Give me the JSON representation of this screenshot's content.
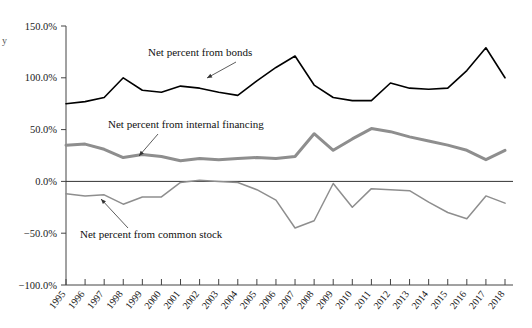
{
  "chart_data": {
    "type": "line",
    "title": "",
    "xlabel": "",
    "ylabel": "",
    "ylim": [
      -100,
      150
    ],
    "yticks": [
      150,
      100,
      50,
      0,
      -50,
      -100
    ],
    "ytick_labels": [
      "150.0%",
      "100.0%",
      "50.0%",
      "0.0%",
      "−50.0%",
      "−100.0%"
    ],
    "grid": false,
    "legend_position": "inline-annotations",
    "zero_line": true,
    "categories": [
      "1995",
      "1996",
      "1997",
      "1998",
      "1999",
      "2000",
      "2001",
      "2002",
      "2003",
      "2004",
      "2005",
      "2006",
      "2007",
      "2008",
      "2009",
      "2010",
      "2011",
      "2012",
      "2013",
      "2014",
      "2015",
      "2016",
      "2017",
      "2018"
    ],
    "series": [
      {
        "name": "Net percent from bonds",
        "color": "#000000",
        "values": [
          75,
          77,
          81,
          100,
          88,
          86,
          92,
          90,
          86,
          83,
          97,
          110,
          121,
          93,
          81,
          78,
          78,
          95,
          90,
          89,
          90,
          107,
          129,
          100
        ]
      },
      {
        "name": "Net percent from internal financing",
        "color": "#8e8e8e",
        "values": [
          35,
          36,
          31,
          23,
          26,
          24,
          20,
          22,
          21,
          22,
          23,
          22,
          24,
          46,
          30,
          41,
          51,
          48,
          43,
          39,
          35,
          30,
          21,
          30
        ]
      },
      {
        "name": "Net percent from common stock",
        "color": "#8e8e8e",
        "values": [
          -12,
          -14,
          -13,
          -22,
          -15,
          -15,
          -1,
          1,
          0,
          -1,
          -8,
          -18,
          -45,
          -38,
          -2,
          -25,
          -7,
          -8,
          -9,
          -20,
          -30,
          -36,
          -14,
          -21
        ]
      }
    ],
    "annotations": [
      {
        "name": "bonds-annotation",
        "text": "Net percent from bonds",
        "x": 148,
        "y": 56
      },
      {
        "name": "internal-financing-annotation",
        "text": "Net percent from internal financing",
        "x": 108,
        "y": 128
      },
      {
        "name": "common-stock-annotation",
        "text": "Net percent from common stock",
        "x": 80,
        "y": 238
      }
    ],
    "corner_mark": "y"
  },
  "axes": {
    "y_axis_name": "percent-axis",
    "x_axis_name": "year-axis"
  }
}
